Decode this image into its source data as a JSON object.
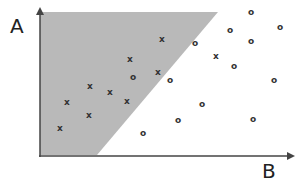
{
  "diagram": {
    "title": "",
    "y_axis_label": "A",
    "x_axis_label": "B",
    "region_color": "#b9b9b9",
    "axis_color": "#444444",
    "marker_color": "#333333",
    "shaded_region": {
      "description": "Region above decision boundary containing class x",
      "polygon": [
        [
          40,
          12
        ],
        [
          218,
          12
        ],
        [
          97,
          155
        ],
        [
          40,
          155
        ]
      ]
    },
    "legend": []
  },
  "chart_data": {
    "type": "scatter",
    "title": "",
    "xlabel": "B",
    "ylabel": "A",
    "grid": false,
    "legend_position": "none",
    "series": [
      {
        "name": "x",
        "marker": "x",
        "points": [
          {
            "px": 162,
            "py": 39
          },
          {
            "px": 130,
            "py": 59
          },
          {
            "px": 158,
            "py": 72
          },
          {
            "px": 90,
            "py": 86
          },
          {
            "px": 110,
            "py": 92
          },
          {
            "px": 67,
            "py": 102
          },
          {
            "px": 127,
            "py": 101
          },
          {
            "px": 89,
            "py": 115
          },
          {
            "px": 60,
            "py": 128
          },
          {
            "px": 216,
            "py": 56
          }
        ]
      },
      {
        "name": "o",
        "marker": "o",
        "points": [
          {
            "px": 133,
            "py": 77
          },
          {
            "px": 170,
            "py": 80
          },
          {
            "px": 195,
            "py": 43
          },
          {
            "px": 230,
            "py": 30
          },
          {
            "px": 251,
            "py": 12
          },
          {
            "px": 280,
            "py": 27
          },
          {
            "px": 251,
            "py": 41
          },
          {
            "px": 234,
            "py": 66
          },
          {
            "px": 274,
            "py": 80
          },
          {
            "px": 202,
            "py": 104
          },
          {
            "px": 178,
            "py": 120
          },
          {
            "px": 143,
            "py": 133
          },
          {
            "px": 253,
            "py": 119
          }
        ]
      }
    ]
  }
}
